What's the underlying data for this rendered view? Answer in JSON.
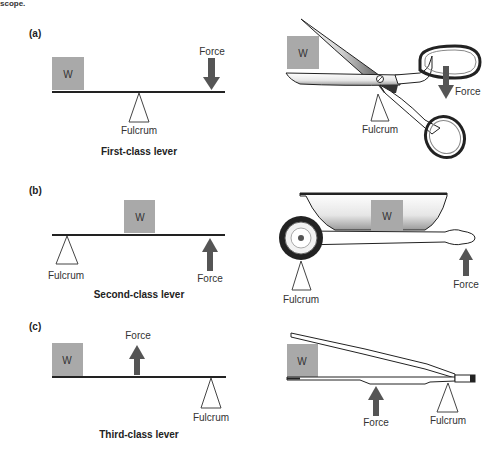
{
  "header_fragment": "scope.",
  "colors": {
    "weight_box": "#a9a9a9",
    "arrow": "#555555",
    "lever": "#222222",
    "fulcrum_stroke": "#444444"
  },
  "panels": [
    {
      "id": "a",
      "label": "(a)",
      "caption": "First-class lever",
      "weight_label": "W",
      "force_label": "Force",
      "fulcrum_label": "Fulcrum",
      "force_direction": "down",
      "example": "scissors",
      "example_weight_label": "W",
      "example_force_label": "Force",
      "example_fulcrum_label": "Fulcrum"
    },
    {
      "id": "b",
      "label": "(b)",
      "caption": "Second-class lever",
      "weight_label": "W",
      "force_label": "Force",
      "fulcrum_label": "Fulcrum",
      "force_direction": "up",
      "example": "wheelbarrow",
      "example_weight_label": "W",
      "example_force_label": "Force",
      "example_fulcrum_label": "Fulcrum"
    },
    {
      "id": "c",
      "label": "(c)",
      "caption": "Third-class lever",
      "weight_label": "W",
      "force_label": "Force",
      "fulcrum_label": "Fulcrum",
      "force_direction": "up",
      "example": "tweezers",
      "example_weight_label": "W",
      "example_force_label": "Force",
      "example_fulcrum_label": "Fulcrum"
    }
  ]
}
